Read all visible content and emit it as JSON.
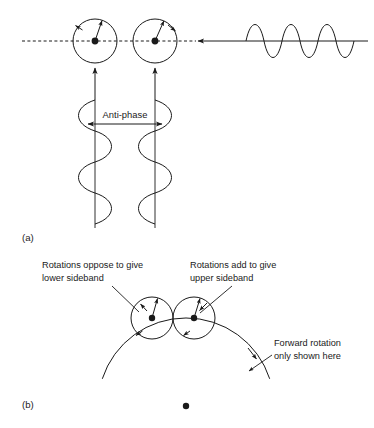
{
  "figure": {
    "background_color": "#ffffff",
    "ink_color": "#1a1a1a"
  },
  "panels": [
    {
      "id": "a",
      "label": "(a)",
      "label_x": 22,
      "label_y": 241,
      "description": "Anti-phase modulation: two counter-rotating vectors on a dashed axis driven by anti-phase sine waves"
    },
    {
      "id": "b",
      "label": "(b)",
      "label_x": 22,
      "label_y": 408,
      "description": "Forward rotation: two vectors riding a large carrier arc, one opposing and one adding"
    }
  ],
  "panel_a": {
    "axis": {
      "name": "dashed-phase-axis",
      "x1": 22,
      "x2": 196,
      "y": 41,
      "style": "dashed"
    },
    "circles": [
      {
        "name": "vector-circle-left",
        "cx": 95,
        "cy": 41,
        "r": 22,
        "vector_angle_deg": 72,
        "rotation": "counter-clockwise",
        "tangent_arrow": "up-left"
      },
      {
        "name": "vector-circle-right",
        "cx": 155,
        "cy": 41,
        "r": 22,
        "vector_angle_deg": 66,
        "rotation": "clockwise",
        "tangent_arrow": "down-right"
      }
    ],
    "feed_arrow": {
      "name": "carrier-feed-arrow",
      "x_from": 246,
      "x_to": 196,
      "y": 41,
      "direction": "left"
    },
    "carrier_wave": {
      "name": "carrier-waveform",
      "x_start": 246,
      "x_end": 368,
      "baseline_y": 41,
      "amplitude": 20,
      "cycles": 2,
      "axis_line": true
    },
    "up_arrows": [
      {
        "name": "drive-arrow-left",
        "x": 95,
        "y_from": 100,
        "y_to": 68
      },
      {
        "name": "drive-arrow-right",
        "x": 155,
        "y_from": 100,
        "y_to": 68
      }
    ],
    "modulation_waves": [
      {
        "name": "modulation-wave-left",
        "axis_x": 95,
        "y_start": 100,
        "y_end": 228,
        "amplitude": 19,
        "cycles": 2,
        "phase": "lead"
      },
      {
        "name": "modulation-wave-right",
        "axis_x": 155,
        "y_start": 100,
        "y_end": 228,
        "amplitude": 19,
        "cycles": 2,
        "phase": "anti"
      }
    ],
    "antiphase_marker": {
      "name": "anti-phase-marker",
      "label": "Anti-phase",
      "x1": 88,
      "x2": 162,
      "y": 124,
      "label_x": 125,
      "label_y": 118,
      "double_headed": true
    }
  },
  "panel_b": {
    "annotations": [
      {
        "name": "annotation-lower-sideband",
        "lines": [
          "Rotations oppose to give",
          "lower sideband"
        ],
        "text_x": 42,
        "text_y": 268,
        "leader": {
          "x1": 112,
          "y1": 285,
          "x2": 137,
          "y2": 311
        }
      },
      {
        "name": "annotation-upper-sideband",
        "lines": [
          "Rotations add to give",
          "upper sideband"
        ],
        "text_x": 190,
        "text_y": 268,
        "leader": {
          "x1": 230,
          "y1": 285,
          "x2": 190,
          "y2": 312
        }
      },
      {
        "name": "annotation-forward-rotation",
        "lines": [
          "Forward rotation",
          "only shown here"
        ],
        "text_x": 274,
        "text_y": 343,
        "leader": {
          "x1": 272,
          "y1": 352,
          "x2": 245,
          "y2": 368
        }
      }
    ],
    "carrier_arc": {
      "name": "carrier-arc",
      "center_x": 186,
      "center_y": 406,
      "radius": 88,
      "start_angle_deg": 198,
      "end_angle_deg": 342,
      "direction_arrow": "clockwise"
    },
    "center_dot": {
      "name": "carrier-center-dot",
      "cx": 186,
      "cy": 406,
      "r": 3.2
    },
    "circles": [
      {
        "name": "sideband-circle-lower",
        "cx": 152,
        "cy": 318,
        "r": 21,
        "vector_angle_deg": 78,
        "rotation": "counter-clockwise",
        "tangent_arrow": "up-left"
      },
      {
        "name": "sideband-circle-upper",
        "cx": 194,
        "cy": 318,
        "r": 21,
        "vector_angle_deg": 74,
        "rotation": "clockwise",
        "tangent_arrow": "down-left"
      }
    ]
  }
}
